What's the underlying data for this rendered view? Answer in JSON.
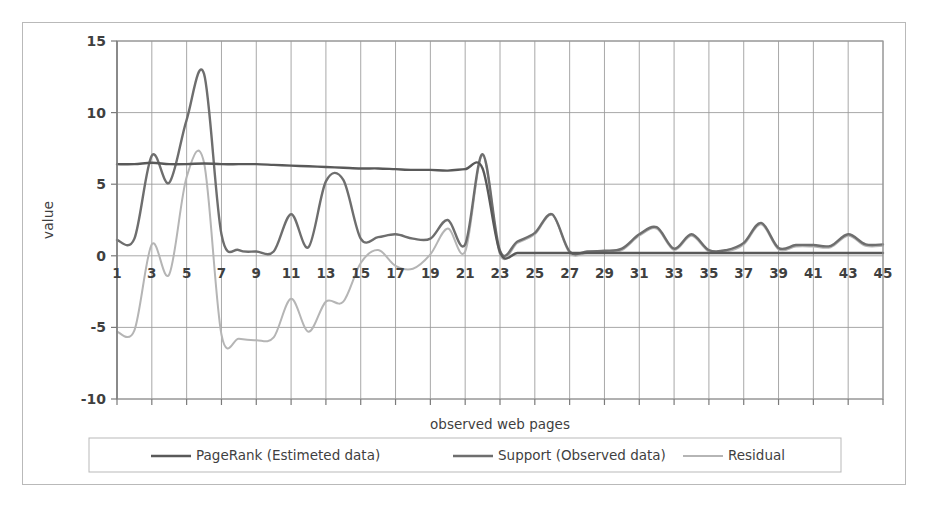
{
  "chart_data": {
    "type": "line",
    "title": "",
    "xlabel": "observed web pages",
    "ylabel": "value",
    "xlim": [
      1,
      45
    ],
    "ylim": [
      -10,
      15
    ],
    "yticks": [
      15,
      10,
      5,
      0,
      -5,
      -10
    ],
    "xticks": [
      1,
      3,
      5,
      7,
      9,
      11,
      13,
      15,
      17,
      19,
      21,
      23,
      25,
      27,
      29,
      31,
      33,
      35,
      37,
      39,
      41,
      43,
      45
    ],
    "grid": "vertical-and-horizontal",
    "legend_position": "bottom",
    "x": [
      1,
      2,
      3,
      4,
      5,
      6,
      7,
      8,
      9,
      10,
      11,
      12,
      13,
      14,
      15,
      16,
      17,
      18,
      19,
      20,
      21,
      22,
      23,
      24,
      25,
      26,
      27,
      28,
      29,
      30,
      31,
      32,
      33,
      34,
      35,
      36,
      37,
      38,
      39,
      40,
      41,
      42,
      43,
      44,
      45
    ],
    "series": [
      {
        "name": "PageRank (Estimeted data)",
        "color": "#595959",
        "values": [
          6.4,
          6.4,
          6.5,
          6.4,
          6.4,
          6.45,
          6.4,
          6.4,
          6.4,
          6.35,
          6.3,
          6.25,
          6.2,
          6.15,
          6.1,
          6.1,
          6.05,
          6.0,
          6.0,
          5.95,
          6.05,
          6.1,
          0.25,
          0.2,
          0.2,
          0.2,
          0.2,
          0.2,
          0.2,
          0.2,
          0.2,
          0.2,
          0.2,
          0.2,
          0.2,
          0.2,
          0.2,
          0.2,
          0.2,
          0.2,
          0.2,
          0.2,
          0.2,
          0.2,
          0.2
        ]
      },
      {
        "name": "Support (Observed data)",
        "color": "#6e6e6e",
        "values": [
          1.1,
          1.2,
          7.0,
          5.1,
          9.5,
          12.7,
          1.5,
          0.4,
          0.3,
          0.3,
          2.9,
          0.6,
          5.2,
          5.3,
          1.2,
          1.3,
          1.5,
          1.2,
          1.2,
          2.5,
          0.8,
          7.1,
          0.35,
          1.0,
          1.6,
          2.9,
          0.3,
          0.3,
          0.35,
          0.5,
          1.5,
          2.0,
          0.5,
          1.5,
          0.4,
          0.4,
          0.9,
          2.3,
          0.55,
          0.75,
          0.75,
          0.7,
          1.5,
          0.8,
          0.8
        ]
      },
      {
        "name": "Residual",
        "color": "#b5b5b5",
        "values": [
          -5.3,
          -5.2,
          0.8,
          -1.3,
          5.5,
          6.5,
          -5.5,
          -5.8,
          -5.9,
          -5.7,
          -3.0,
          -5.3,
          -3.2,
          -3.2,
          -0.5,
          0.4,
          -0.7,
          -0.9,
          0.1,
          1.9,
          0.3,
          7.0,
          0.1,
          0.9,
          1.5,
          2.85,
          0.2,
          0.2,
          0.25,
          0.4,
          1.4,
          1.9,
          0.4,
          1.4,
          0.3,
          0.3,
          0.8,
          2.2,
          0.45,
          0.65,
          0.65,
          0.6,
          1.4,
          0.7,
          0.7
        ]
      }
    ]
  },
  "legend": {
    "items": [
      {
        "label": "PageRank (Estimeted data)",
        "color": "#595959"
      },
      {
        "label": "Support (Observed data)",
        "color": "#6e6e6e"
      },
      {
        "label": "Residual",
        "color": "#b5b5b5"
      }
    ]
  },
  "axes": {
    "y_title": "value",
    "x_title": "observed web pages",
    "y_tick_labels": [
      "15",
      "10",
      "5",
      "0",
      "-5",
      "-10"
    ],
    "x_tick_labels": [
      "1",
      "3",
      "5",
      "7",
      "9",
      "11",
      "13",
      "15",
      "17",
      "19",
      "21",
      "23",
      "25",
      "27",
      "29",
      "31",
      "33",
      "35",
      "37",
      "39",
      "41",
      "43",
      "45"
    ]
  },
  "colors": {
    "grid": "#9a9a9a",
    "frame": "#b9b9b9",
    "axis": "#7a7a7a",
    "text": "#3f3f3f"
  }
}
